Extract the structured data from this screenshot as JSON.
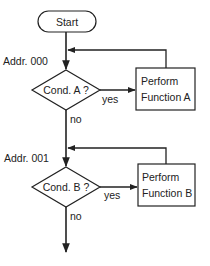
{
  "diagram": {
    "type": "flowchart",
    "colors": {
      "stroke": "#222222",
      "background": "#ffffff"
    },
    "start": {
      "label": "Start"
    },
    "blocks": [
      {
        "address": "Addr. 000",
        "condition": "Cond. A ?",
        "yes_label": "yes",
        "no_label": "no",
        "action_line1": "Perform",
        "action_line2": "Function A"
      },
      {
        "address": "Addr. 001",
        "condition": "Cond. B ?",
        "yes_label": "yes",
        "no_label": "no",
        "action_line1": "Perform",
        "action_line2": "Function B"
      }
    ]
  }
}
